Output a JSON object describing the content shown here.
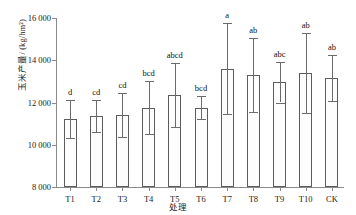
{
  "chart_data": {
    "type": "bar",
    "title": "",
    "xlabel": "处理",
    "ylabel": "玉米产量/ (kg/hm²)",
    "categories": [
      "T1",
      "T2",
      "T3",
      "T4",
      "T5",
      "T6",
      "T7",
      "T8",
      "T9",
      "T10",
      "CK"
    ],
    "values": [
      11200,
      11350,
      11400,
      11750,
      12350,
      11750,
      13600,
      13300,
      12950,
      13400,
      13150
    ],
    "errors_upper": [
      900,
      750,
      1050,
      1250,
      1500,
      550,
      2150,
      1750,
      950,
      1900,
      1100
    ],
    "errors_lower": [
      900,
      750,
      1050,
      1250,
      1500,
      550,
      2150,
      1750,
      950,
      1900,
      1100
    ],
    "significance_letters": [
      "d",
      "cd",
      "cd",
      "bcd",
      "abcd",
      "bcd",
      "a",
      "ab",
      "abc",
      "ab",
      "ab"
    ],
    "ylim": [
      8000,
      16000
    ],
    "yticks": [
      8000,
      10000,
      12000,
      14000,
      16000
    ],
    "ytick_labels": [
      "8 000",
      "10 000",
      "12 000",
      "14 000",
      "16 000"
    ],
    "grid": false,
    "legend": "none",
    "bar_fill": "#fdfdfd",
    "bar_edge": "#5c5c5c",
    "axis_color": "#8a8a8a"
  }
}
